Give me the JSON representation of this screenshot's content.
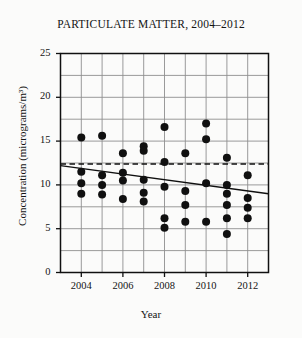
{
  "chart_data": {
    "type": "scatter",
    "title": "PARTICULATE MATTER, 2004–2012",
    "xlabel": "Year",
    "ylabel": "Concentration (micrograms/m³)",
    "xlim": [
      2003,
      2013
    ],
    "ylim": [
      0,
      25
    ],
    "x_ticks": [
      2004,
      2006,
      2008,
      2010,
      2012
    ],
    "x_tick_labels": [
      "2004",
      "2006",
      "2008",
      "2010",
      "2012"
    ],
    "x_minor_ticks": [
      2003,
      2004,
      2005,
      2006,
      2007,
      2008,
      2009,
      2010,
      2011,
      2012,
      2013
    ],
    "y_ticks": [
      0,
      5,
      10,
      15,
      20,
      25
    ],
    "y_tick_labels": [
      "0",
      "5",
      "10",
      "15",
      "20",
      "25"
    ],
    "y_minor_ticks": [
      0,
      2.5,
      5,
      7.5,
      10,
      12.5,
      15,
      17.5,
      20,
      22.5,
      25
    ],
    "grid": true,
    "legend": null,
    "marker": "filled-circle",
    "marker_color": "#101010",
    "marker_size": 5.4,
    "series": [
      {
        "name": "Particulate matter readings",
        "points": [
          [
            2004,
            15.4
          ],
          [
            2004,
            11.5
          ],
          [
            2004,
            10.2
          ],
          [
            2004,
            9.0
          ],
          [
            2005,
            15.6
          ],
          [
            2005,
            11.1
          ],
          [
            2005,
            10.0
          ],
          [
            2005,
            8.9
          ],
          [
            2006,
            13.6
          ],
          [
            2006,
            11.4
          ],
          [
            2006,
            10.5
          ],
          [
            2006,
            8.4
          ],
          [
            2007,
            14.4
          ],
          [
            2007,
            13.9
          ],
          [
            2007,
            10.6
          ],
          [
            2007,
            9.1
          ],
          [
            2007,
            8.1
          ],
          [
            2008,
            16.6
          ],
          [
            2008,
            12.6
          ],
          [
            2008,
            9.8
          ],
          [
            2008,
            6.2
          ],
          [
            2008,
            5.1
          ],
          [
            2009,
            13.6
          ],
          [
            2009,
            9.3
          ],
          [
            2009,
            7.7
          ],
          [
            2009,
            5.8
          ],
          [
            2010,
            17.0
          ],
          [
            2010,
            15.2
          ],
          [
            2010,
            10.2
          ],
          [
            2010,
            5.8
          ],
          [
            2011,
            13.1
          ],
          [
            2011,
            10.0
          ],
          [
            2011,
            9.0
          ],
          [
            2011,
            7.7
          ],
          [
            2011,
            6.2
          ],
          [
            2011,
            4.4
          ],
          [
            2012,
            11.1
          ],
          [
            2012,
            8.5
          ],
          [
            2012,
            7.4
          ],
          [
            2012,
            6.2
          ]
        ]
      }
    ],
    "annotations": [
      {
        "name": "mean-reference-line",
        "style": "dashed",
        "orientation": "horizontal",
        "value": 12.4,
        "color": "#101010"
      },
      {
        "name": "trend-line",
        "style": "solid",
        "x_start": 2003,
        "y_start": 12.2,
        "x_end": 2013,
        "y_end": 9.0,
        "color": "#101010"
      }
    ]
  },
  "figure": {
    "background": "#fbfbfa",
    "axis_color": "#101010",
    "grid_color": "#8e8e8e"
  }
}
